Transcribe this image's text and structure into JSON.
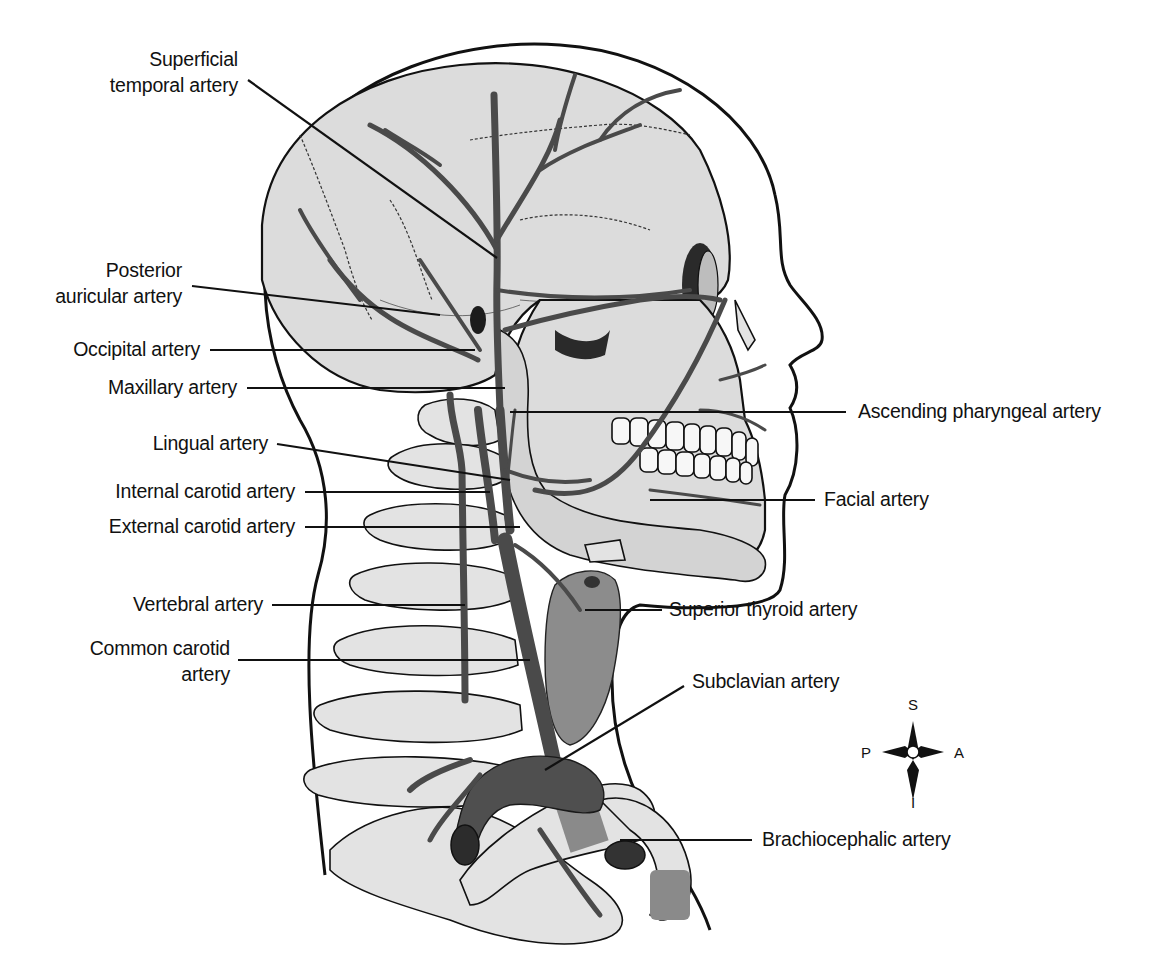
{
  "figure": {
    "labels_left": [
      {
        "id": "superficial-temporal",
        "lines": [
          "Superficial",
          "temporal artery"
        ]
      },
      {
        "id": "posterior-auricular",
        "lines": [
          "Posterior",
          "auricular artery"
        ]
      },
      {
        "id": "occipital",
        "lines": [
          "Occipital artery"
        ]
      },
      {
        "id": "maxillary",
        "lines": [
          "Maxillary artery"
        ]
      },
      {
        "id": "lingual",
        "lines": [
          "Lingual artery"
        ]
      },
      {
        "id": "internal-carotid",
        "lines": [
          "Internal carotid artery"
        ]
      },
      {
        "id": "external-carotid",
        "lines": [
          "External carotid artery"
        ]
      },
      {
        "id": "vertebral",
        "lines": [
          "Vertebral artery"
        ]
      },
      {
        "id": "common-carotid",
        "lines": [
          "Common carotid",
          "artery"
        ]
      }
    ],
    "labels_right": [
      {
        "id": "ascending-pharyngeal",
        "lines": [
          "Ascending pharyngeal artery"
        ]
      },
      {
        "id": "facial",
        "lines": [
          "Facial artery"
        ]
      },
      {
        "id": "superior-thyroid",
        "lines": [
          "Superior thyroid artery"
        ]
      },
      {
        "id": "subclavian",
        "lines": [
          "Subclavian artery"
        ]
      },
      {
        "id": "brachiocephalic",
        "lines": [
          "Brachiocephalic artery"
        ]
      }
    ],
    "compass": {
      "superior": "S",
      "inferior": "I",
      "posterior": "P",
      "anterior": "A"
    },
    "colors": {
      "background": "#ffffff",
      "line": "#111111",
      "skull_fill": "#dcdcdc",
      "bone_fill": "#e3e3e3",
      "artery": "#4a4a4a",
      "thyroid": "#8c8c8c"
    }
  }
}
